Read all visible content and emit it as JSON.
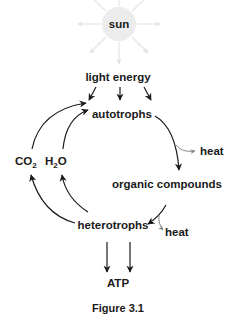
{
  "diagram": {
    "nodes": {
      "sun": "sun",
      "light_energy": "light energy",
      "autotrophs": "autotrophs",
      "heat_autotrophs": "heat",
      "organic_compounds": "organic compounds",
      "co2_main": "CO",
      "co2_sub": "2",
      "h2o_pre": "H",
      "h2o_sub": "2",
      "h2o_post": "O",
      "heterotrophs": "heterotrophs",
      "heat_heterotrophs": "heat",
      "atp": "ATP"
    },
    "edges": [
      {
        "from": "sun",
        "to": "light energy",
        "style": "faint"
      },
      {
        "from": "light energy",
        "to": "autotrophs",
        "count": 3
      },
      {
        "from": "autotrophs",
        "to": "organic compounds"
      },
      {
        "from": "autotrophs",
        "to": "heat",
        "style": "gray"
      },
      {
        "from": "organic compounds",
        "to": "heterotrophs"
      },
      {
        "from": "organic compounds",
        "to": "heat",
        "style": "gray"
      },
      {
        "from": "heterotrophs",
        "to": "CO2"
      },
      {
        "from": "heterotrophs",
        "to": "H2O"
      },
      {
        "from": "CO2",
        "to": "autotrophs"
      },
      {
        "from": "H2O",
        "to": "autotrophs"
      },
      {
        "from": "heterotrophs",
        "to": "ATP",
        "count": 2
      }
    ],
    "colors": {
      "sun_fill": "#ececec",
      "text": "#1a1a1a",
      "heat_arrow": "#888888",
      "rays": "#e4e4e4"
    },
    "caption": "Figure 3.1"
  }
}
